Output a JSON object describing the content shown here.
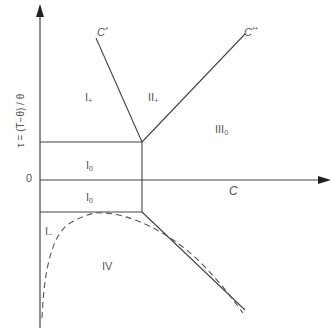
{
  "diagram": {
    "title": "",
    "axes": {
      "y_label": "τ = (T−θ) / θ",
      "y_zero_label": "0",
      "x_label": "C"
    },
    "curves": {
      "c_star_label_main": "C",
      "c_star_label_sup": "*",
      "c_double_star_label_main": "C",
      "c_double_star_label_sup": "**"
    },
    "regions": [
      {
        "id": "I_plus",
        "main": "I",
        "sub": "+"
      },
      {
        "id": "II_plus",
        "main": "II",
        "sub": "+"
      },
      {
        "id": "III_0",
        "main": "III",
        "sub": "0"
      },
      {
        "id": "I_0_upper",
        "main": "I",
        "sub": "0"
      },
      {
        "id": "I_0_lower",
        "main": "I",
        "sub": "0"
      },
      {
        "id": "I_minus",
        "main": "I",
        "sub": "−"
      },
      {
        "id": "IV",
        "main": "IV",
        "sub": ""
      }
    ],
    "colors": {
      "line": "#444444",
      "dashed": "#555555",
      "text": "#555555"
    }
  }
}
